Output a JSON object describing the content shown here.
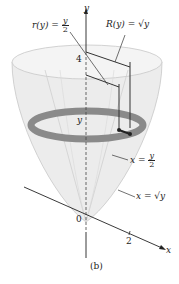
{
  "figure": {
    "caption": "(b)",
    "axes": {
      "y_label": "y",
      "x_label": "x",
      "origin_label": "0",
      "y_tick": "4",
      "x_tick": "2",
      "slice_label": "y"
    },
    "labels": {
      "inner_radius": {
        "lhs": "r(y) =",
        "num": "y",
        "den": "2"
      },
      "outer_radius": {
        "text": "R(y) = √y"
      },
      "inner_curve": {
        "lhs": "x =",
        "num": "y",
        "den": "2"
      },
      "outer_curve": {
        "text": "x = √y"
      }
    },
    "colors": {
      "solid_fill": "#e6e6e6",
      "ring_fill": "#8a8a8a",
      "ink": "#222222"
    }
  }
}
